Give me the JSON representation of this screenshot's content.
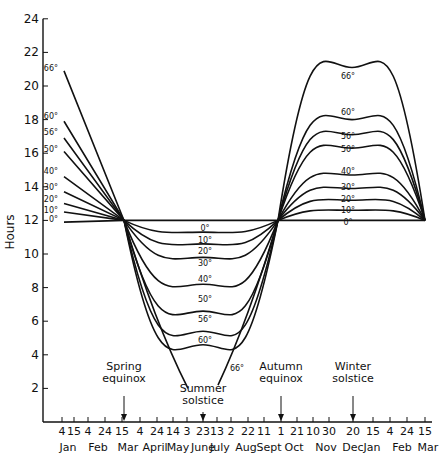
{
  "chart_data": {
    "type": "line",
    "title": "",
    "xlabel": "",
    "ylabel": "Hours",
    "ylim": [
      0,
      24
    ],
    "yticks": [
      2,
      4,
      6,
      8,
      10,
      12,
      14,
      16,
      18,
      20,
      22,
      24
    ],
    "grid": false,
    "x_day_ticks": [
      "4",
      "15",
      "4",
      "24",
      "15",
      "4",
      "24",
      "14",
      "3",
      "23",
      "13",
      "2",
      "22",
      "11",
      "1",
      "21",
      "10",
      "30",
      "20",
      "15",
      "4",
      "24",
      "15"
    ],
    "x_month_labels": [
      "Jan",
      "Feb",
      "Mar",
      "April",
      "May",
      "June",
      "July",
      "Aug",
      "Sept",
      "Oct",
      "Nov",
      "Dec",
      "Jan",
      "Feb",
      "Mar"
    ],
    "key_points": [
      "Jan 4",
      "Spring equinox (Mar 15)",
      "Summer solstice (June 23)",
      "Autumn equinox (Sept ~25)",
      "Winter solstice (Dec 20)",
      "Mar 15"
    ],
    "series": [
      {
        "name": "0°",
        "values": [
          11.9,
          12.0,
          12.0,
          12.0,
          12.0,
          12.0
        ]
      },
      {
        "name": "10°",
        "values": [
          12.5,
          12.0,
          11.3,
          12.0,
          12.6,
          12.0
        ]
      },
      {
        "name": "20°",
        "values": [
          13.0,
          12.0,
          10.6,
          12.0,
          13.2,
          12.0
        ]
      },
      {
        "name": "30°",
        "values": [
          13.7,
          12.0,
          9.8,
          12.0,
          13.9,
          12.0
        ]
      },
      {
        "name": "40°",
        "values": [
          14.6,
          12.0,
          8.2,
          12.0,
          14.7,
          12.0
        ]
      },
      {
        "name": "50°",
        "values": [
          16.1,
          12.0,
          6.6,
          12.0,
          16.3,
          12.0
        ]
      },
      {
        "name": "56°",
        "values": [
          16.9,
          12.0,
          5.4,
          12.0,
          17.1,
          12.0
        ]
      },
      {
        "name": "60°",
        "values": [
          17.9,
          12.0,
          4.6,
          12.0,
          18.0,
          12.0
        ]
      },
      {
        "name": "66°",
        "values": [
          20.9,
          12.0,
          0.0,
          12.0,
          21.1,
          12.0
        ]
      }
    ],
    "annotations": [
      {
        "text_lines": [
          "Spring",
          "equinox"
        ],
        "date": "Mar 15"
      },
      {
        "text_lines": [
          "Summer",
          "solstice"
        ],
        "date": "June 23"
      },
      {
        "text_lines": [
          "Autumn",
          "equinox"
        ],
        "date": "Sept/Oct 1"
      },
      {
        "text_lines": [
          "Winter",
          "solstice"
        ],
        "date": "Dec 20"
      }
    ]
  },
  "layout": {
    "x_axis_y": 422,
    "y_axis_x": 43,
    "px_per_hour": 16.8,
    "x_key_px": [
      64,
      124,
      203,
      278,
      352,
      425
    ],
    "x_tick_px": [
      62,
      74,
      88,
      105,
      122,
      140,
      157,
      173,
      187,
      203,
      217,
      231,
      248,
      264,
      281,
      297,
      313,
      329,
      353,
      373,
      390,
      407,
      425
    ],
    "x_month_px": [
      68,
      98,
      128,
      155,
      178,
      203,
      220,
      246,
      269,
      294,
      326,
      353,
      372,
      402,
      428
    ],
    "annotation_px": [
      {
        "x": 124,
        "text_y": 382,
        "arrow_top": 396
      },
      {
        "x": 203,
        "text_y": 404,
        "arrow_top": 412
      },
      {
        "x": 281,
        "text_y": 382,
        "arrow_top": 396
      },
      {
        "x": 353,
        "text_y": 382,
        "arrow_top": 396
      }
    ],
    "left_label_px": [
      [
        58,
        222
      ],
      [
        58,
        213
      ],
      [
        58,
        202
      ],
      [
        58,
        190
      ],
      [
        58,
        174
      ],
      [
        58,
        152
      ],
      [
        58,
        135
      ],
      [
        58,
        119
      ],
      [
        58,
        71
      ]
    ],
    "mid_label_px": [
      [
        205,
        231
      ],
      [
        205,
        243
      ],
      [
        205,
        254
      ],
      [
        205,
        266
      ],
      [
        205,
        282
      ],
      [
        205,
        302
      ],
      [
        205,
        322
      ],
      [
        205,
        343
      ],
      [
        237,
        371
      ]
    ],
    "right_label_px": [
      [
        348,
        225
      ],
      [
        348,
        213
      ],
      [
        348,
        202
      ],
      [
        348,
        190
      ],
      [
        348,
        174
      ],
      [
        348,
        152
      ],
      [
        348,
        139
      ],
      [
        348,
        115
      ],
      [
        348,
        79
      ]
    ]
  }
}
